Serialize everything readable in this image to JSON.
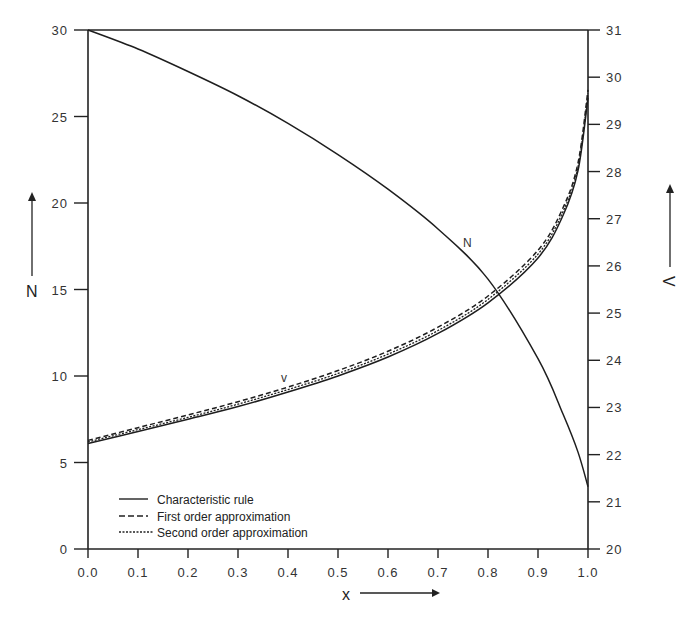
{
  "chart_data": {
    "type": "line",
    "title": "",
    "xlabel": "x",
    "ylabel_left": "N",
    "ylabel_right": "V",
    "xlim": [
      0.0,
      1.0
    ],
    "ylim_left": [
      0,
      30
    ],
    "ylim_right": [
      20,
      31
    ],
    "grid": false,
    "legend_position": "lower left",
    "x_ticks": [
      "0.0",
      "0.1",
      "0.2",
      "0.3",
      "0.4",
      "0.5",
      "0.6",
      "0.7",
      "0.8",
      "0.9",
      "1.0"
    ],
    "y_left_ticks": [
      "0",
      "5",
      "10",
      "15",
      "20",
      "25",
      "30"
    ],
    "y_right_ticks": [
      "20",
      "21",
      "22",
      "23",
      "24",
      "25",
      "26",
      "27",
      "28",
      "29",
      "30",
      "31"
    ],
    "legend": [
      {
        "label": "Characteristic rule",
        "style": "solid"
      },
      {
        "label": "First order approximation",
        "style": "dashed"
      },
      {
        "label": "Second order approximation",
        "style": "dotted"
      }
    ],
    "annotations": [
      {
        "text": "N",
        "x": 0.76,
        "y_left": 16.0
      },
      {
        "text": "V",
        "x": 0.39,
        "y_left": 9.5
      }
    ],
    "x": [
      0.0,
      0.1,
      0.2,
      0.3,
      0.4,
      0.5,
      0.6,
      0.7,
      0.8,
      0.9,
      0.95,
      0.98,
      1.0
    ],
    "series": [
      {
        "name": "N (Characteristic rule)",
        "axis": "left",
        "style": "solid",
        "values": [
          30.0,
          28.9,
          27.6,
          26.2,
          24.6,
          22.8,
          20.8,
          18.5,
          15.6,
          11.0,
          7.8,
          5.6,
          3.6
        ]
      },
      {
        "name": "V (Characteristic rule)",
        "axis": "right",
        "style": "solid",
        "values": [
          22.27,
          22.52,
          22.78,
          23.05,
          23.36,
          23.7,
          24.1,
          24.6,
          25.25,
          26.2,
          27.1,
          28.05,
          29.6
        ]
      },
      {
        "name": "V (First order approximation)",
        "axis": "right",
        "style": "dashed",
        "values": [
          22.27,
          22.54,
          22.81,
          23.09,
          23.4,
          23.75,
          24.16,
          24.67,
          25.33,
          26.3,
          27.2,
          28.15,
          29.7
        ]
      },
      {
        "name": "V (Second order approximation)",
        "axis": "right",
        "style": "dotted",
        "values": [
          22.27,
          22.53,
          22.79,
          23.07,
          23.38,
          23.72,
          24.13,
          24.63,
          25.29,
          26.25,
          27.15,
          28.1,
          29.65
        ]
      }
    ]
  },
  "labels": {
    "x_axis_title": "x",
    "left_axis_title": "N",
    "right_axis_title": "V",
    "legend_solid": "Characteristic rule",
    "legend_dashed": "First order approximation",
    "legend_dotted": "Second order approximation",
    "annotation_n": "N",
    "annotation_v": "v"
  }
}
